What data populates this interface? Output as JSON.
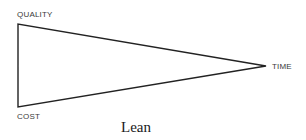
{
  "diagram": {
    "type": "triangle",
    "caption": "Lean",
    "vertices": {
      "quality": {
        "label": "QUALITY"
      },
      "cost": {
        "label": "COST"
      },
      "time": {
        "label": "TIME"
      }
    },
    "colors": {
      "line": "#222222",
      "label": "#3a3a3a",
      "background": "#ffffff"
    }
  }
}
